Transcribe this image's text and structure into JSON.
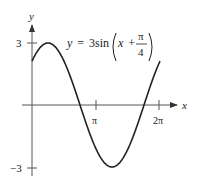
{
  "chart_data": {
    "type": "line",
    "title": "",
    "equation": {
      "lhs": "y",
      "eq": "=",
      "coef": "3sin",
      "inner_var": "x",
      "plus": "+",
      "num": "π",
      "den": "4"
    },
    "xlabel": "x",
    "ylabel": "y",
    "x_ticks": [
      "π",
      "2π"
    ],
    "y_ticks": [
      "3",
      "−3"
    ],
    "xlim": [
      0,
      6.2832
    ],
    "ylim": [
      -3,
      3
    ],
    "grid": false,
    "series": [
      {
        "name": "y = 3sin(x + π/4)",
        "x": [
          0,
          0.7854,
          1.5708,
          2.3562,
          3.1416,
          3.927,
          4.7124,
          5.4978,
          6.2832
        ],
        "values": [
          2.12,
          3,
          2.12,
          0,
          -2.12,
          -3,
          -2.12,
          0,
          2.12
        ]
      }
    ]
  }
}
